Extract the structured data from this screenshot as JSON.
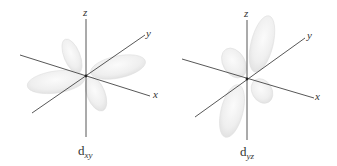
{
  "figure": {
    "colors": {
      "background": "#ffffff",
      "axis": "#444444",
      "lobe_fill": "#f1f1f1",
      "lobe_edge": "#dcdcdc",
      "text": "#333333"
    },
    "panels": [
      {
        "id": "dxy",
        "label_main": "d",
        "label_sub": "xy",
        "axes": {
          "x": "x",
          "y": "y",
          "z": "z"
        },
        "lobes_plane": "xy",
        "lobe_count": 4
      },
      {
        "id": "dyz",
        "label_main": "d",
        "label_sub": "yz",
        "axes": {
          "x": "x",
          "y": "y",
          "z": "z"
        },
        "lobes_plane": "yz",
        "lobe_count": 4
      }
    ]
  }
}
